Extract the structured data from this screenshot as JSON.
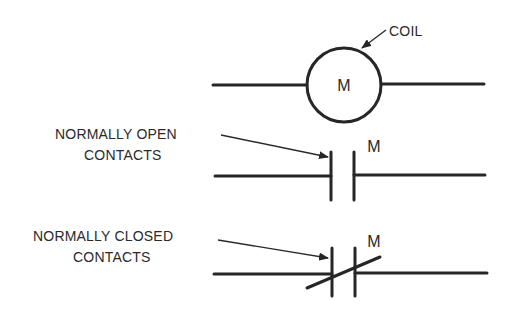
{
  "diagram": {
    "coil": {
      "symbol_label": "M",
      "callout_label": "COIL",
      "center": [
        344,
        85
      ],
      "radius": 37,
      "wire_y": 85,
      "wire_left": [
        213,
        307
      ],
      "wire_right": [
        381,
        484
      ]
    },
    "normally_open": {
      "callout_line1": "NORMALLY OPEN",
      "callout_line2": "CONTACTS",
      "symbol_label": "M",
      "wire_y": 176,
      "left_bar_x": 331,
      "right_bar_x": 354,
      "bar_top": 152,
      "bar_bottom": 200
    },
    "normally_closed": {
      "callout_line1": "NORMALLY CLOSED",
      "callout_line2": "CONTACTS",
      "symbol_label": "M",
      "wire_y": 273,
      "left_bar_x": 332,
      "right_bar_x": 355,
      "bar_top": 248,
      "bar_bottom": 296,
      "diagonal": [
        [
          307,
          288
        ],
        [
          380,
          257
        ]
      ]
    },
    "colors": {
      "ink": "#262626",
      "background": "#ffffff"
    }
  }
}
